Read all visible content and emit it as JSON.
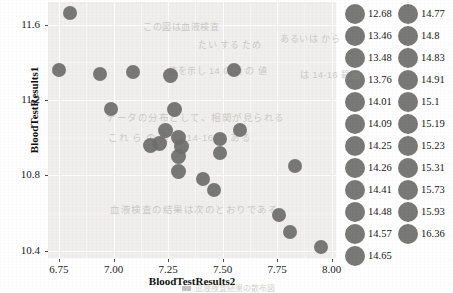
{
  "chart_data": {
    "type": "scatter",
    "title": "",
    "xlabel": "BloodTestResults2",
    "ylabel": "BloodTestResults1",
    "xlim": [
      6.7,
      8.02
    ],
    "ylim": [
      10.36,
      11.72
    ],
    "xticks": [
      "6.75",
      "7.00",
      "7.25",
      "7.50",
      "7.75",
      "8.00"
    ],
    "xtick_values": [
      6.75,
      7.0,
      7.25,
      7.5,
      7.75,
      8.0
    ],
    "yticks": [
      "10.4",
      "10.8",
      "11.2",
      "11.6"
    ],
    "ytick_values": [
      10.4,
      10.8,
      11.2,
      11.6
    ],
    "grid": true,
    "legend_position": "right",
    "marker": "filled-circle",
    "marker_color": "#6f6f6d",
    "panel_color": "#f0efed",
    "points": [
      {
        "x": 6.8,
        "y": 11.66,
        "size": 14
      },
      {
        "x": 6.75,
        "y": 11.36,
        "size": 14
      },
      {
        "x": 6.94,
        "y": 11.34,
        "size": 14
      },
      {
        "x": 7.09,
        "y": 11.35,
        "size": 14
      },
      {
        "x": 7.26,
        "y": 11.33,
        "size": 15
      },
      {
        "x": 7.55,
        "y": 11.36,
        "size": 14
      },
      {
        "x": 6.99,
        "y": 11.15,
        "size": 14
      },
      {
        "x": 7.28,
        "y": 11.15,
        "size": 15
      },
      {
        "x": 7.58,
        "y": 11.04,
        "size": 14
      },
      {
        "x": 7.24,
        "y": 11.04,
        "size": 15
      },
      {
        "x": 7.3,
        "y": 11.0,
        "size": 15
      },
      {
        "x": 7.17,
        "y": 10.96,
        "size": 15
      },
      {
        "x": 7.21,
        "y": 10.97,
        "size": 15
      },
      {
        "x": 7.31,
        "y": 10.95,
        "size": 15
      },
      {
        "x": 7.49,
        "y": 10.99,
        "size": 14
      },
      {
        "x": 7.3,
        "y": 10.9,
        "size": 15
      },
      {
        "x": 7.49,
        "y": 10.92,
        "size": 14
      },
      {
        "x": 7.3,
        "y": 10.82,
        "size": 15
      },
      {
        "x": 7.41,
        "y": 10.78,
        "size": 14
      },
      {
        "x": 7.46,
        "y": 10.72,
        "size": 14
      },
      {
        "x": 7.83,
        "y": 10.85,
        "size": 14
      },
      {
        "x": 7.76,
        "y": 10.59,
        "size": 14
      },
      {
        "x": 7.81,
        "y": 10.5,
        "size": 14
      },
      {
        "x": 7.95,
        "y": 10.42,
        "size": 14
      }
    ]
  },
  "axes": {
    "y_title": "BloodTestResults1",
    "x_title": "BloodTestResults2",
    "y_ticks": [
      {
        "label": "11.6",
        "value": 11.6
      },
      {
        "label": "11.2",
        "value": 11.2
      },
      {
        "label": "10.8",
        "value": 10.8
      },
      {
        "label": "10.4",
        "value": 10.4
      }
    ],
    "x_ticks": [
      {
        "label": "6.75",
        "value": 6.75
      },
      {
        "label": "7.00",
        "value": 7.0
      },
      {
        "label": "7.25",
        "value": 7.25
      },
      {
        "label": "7.50",
        "value": 7.5
      },
      {
        "label": "7.75",
        "value": 7.75
      },
      {
        "label": "8.00",
        "value": 8.0
      }
    ]
  },
  "legend": {
    "columns": [
      {
        "items": [
          {
            "label": "12.68"
          },
          {
            "label": "13.46"
          },
          {
            "label": "13.48"
          },
          {
            "label": "13.76"
          },
          {
            "label": "14.01"
          },
          {
            "label": "14.09"
          },
          {
            "label": "14.25"
          },
          {
            "label": "14.26"
          },
          {
            "label": "14.41"
          },
          {
            "label": "14.48"
          },
          {
            "label": "14.57"
          },
          {
            "label": "14.65"
          }
        ]
      },
      {
        "items": [
          {
            "label": "14.77"
          },
          {
            "label": "14.8"
          },
          {
            "label": "14.83"
          },
          {
            "label": "14.91"
          },
          {
            "label": "15.1"
          },
          {
            "label": "15.19"
          },
          {
            "label": "15.23"
          },
          {
            "label": "15.31"
          },
          {
            "label": "15.73"
          },
          {
            "label": "15.93"
          },
          {
            "label": "16.36"
          }
        ]
      }
    ]
  },
  "bleed_through": [
    {
      "text": "この図は血液検査",
      "x": 95,
      "y": 18,
      "size": 9
    },
    {
      "text": "たい する ため",
      "x": 150,
      "y": 36,
      "size": 9
    },
    {
      "text": "あるいは から",
      "x": 232,
      "y": 30,
      "size": 9
    },
    {
      "text": "値を示し 14 の項 の 値",
      "x": 120,
      "y": 62,
      "size": 9
    },
    {
      "text": "は 14-16 範囲",
      "x": 252,
      "y": 66,
      "size": 9
    },
    {
      "text": "データの分布として、相関が見られる",
      "x": 58,
      "y": 108,
      "size": 9.5
    },
    {
      "text": "これ ら の 値 は 14-16 で ある",
      "x": 60,
      "y": 128,
      "size": 9.5
    },
    {
      "text": "血液検査の結果は次のとおりである",
      "x": 62,
      "y": 200,
      "size": 9.5
    }
  ],
  "caption": {
    "text": "血液検査結果の散布図",
    "marker": "legend-key-marker"
  }
}
